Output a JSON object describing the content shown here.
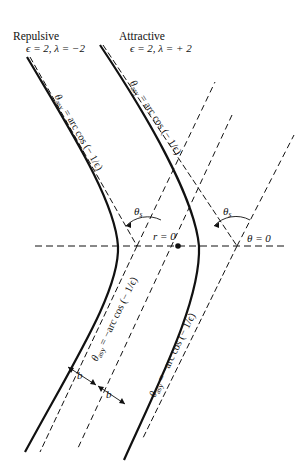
{
  "labels": {
    "repulsive": {
      "title": "Repulsive",
      "params": "ϵ = 2, λ = −2"
    },
    "attractive": {
      "title": "Attractive",
      "params": "ϵ = 2, λ = + 2"
    },
    "asymptote_upper": "θ",
    "asymptote_sub": "asy",
    "asymptote_upper_expr": " = arc cos (− 1/ϵ)",
    "asymptote_lower_expr": " = −arc cos (− 1/ϵ)",
    "theta_s": "θ",
    "theta_s_sub": "s",
    "r_zero": "r = 0",
    "theta_zero": "θ = 0",
    "impact_b": "b"
  },
  "colors": {
    "ink": "#111111",
    "background": "#ffffff"
  },
  "geometry": {
    "axis_y": 246,
    "left_vertex": [
      137,
      246
    ],
    "right_vertex": [
      237,
      246
    ],
    "origin_dot": [
      178,
      246
    ]
  }
}
